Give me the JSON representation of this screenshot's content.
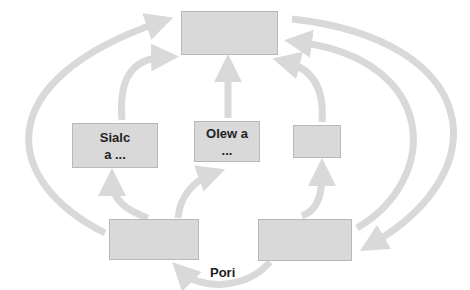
{
  "diagram": {
    "top_cut_text": "",
    "nodes": [
      {
        "id": "top",
        "line1": "",
        "line2": ""
      },
      {
        "id": "left-middle",
        "line1": "Sialc",
        "line2": "a ..."
      },
      {
        "id": "center-middle",
        "line1": "Olew a",
        "line2": "..."
      },
      {
        "id": "right-middle",
        "line1": "",
        "line2": ""
      },
      {
        "id": "bottom-left",
        "line1": "",
        "line2": ""
      },
      {
        "id": "bottom-right",
        "line1": "",
        "line2": ""
      }
    ],
    "edge_labels": {
      "bottom": "Pori"
    },
    "colors": {
      "box_fill": "#d9d9d9",
      "box_border": "#b9b9b9",
      "arrow": "#d9d9d9"
    }
  }
}
